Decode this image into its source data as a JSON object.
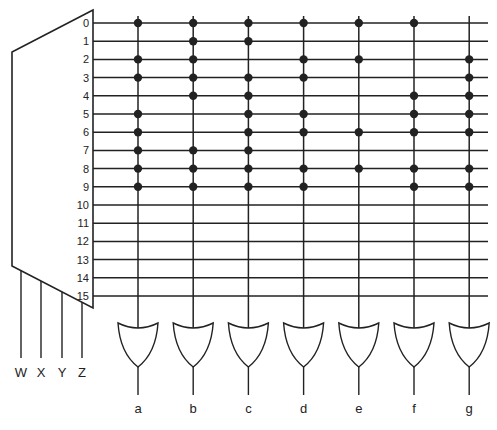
{
  "diagram": {
    "type": "decoder-or-plane",
    "colors": {
      "line": "#222222",
      "dot": "#222222",
      "background": "#ffffff"
    },
    "decoder": {
      "inputs": [
        "W",
        "X",
        "Y",
        "Z"
      ],
      "outputs": [
        "0",
        "1",
        "2",
        "3",
        "4",
        "5",
        "6",
        "7",
        "8",
        "9",
        "10",
        "11",
        "12",
        "13",
        "14",
        "15"
      ]
    },
    "or_gates": [
      {
        "label": "a",
        "connections": [
          0,
          2,
          3,
          5,
          6,
          7,
          8,
          9
        ]
      },
      {
        "label": "b",
        "connections": [
          0,
          1,
          2,
          3,
          4,
          7,
          8,
          9
        ]
      },
      {
        "label": "c",
        "connections": [
          0,
          1,
          3,
          4,
          5,
          6,
          7,
          8,
          9
        ]
      },
      {
        "label": "d",
        "connections": [
          0,
          2,
          3,
          5,
          6,
          8,
          9
        ]
      },
      {
        "label": "e",
        "connections": [
          0,
          2,
          6,
          8
        ]
      },
      {
        "label": "f",
        "connections": [
          0,
          4,
          5,
          6,
          8,
          9
        ]
      },
      {
        "label": "g",
        "connections": [
          2,
          3,
          4,
          5,
          6,
          8,
          9
        ]
      }
    ]
  }
}
